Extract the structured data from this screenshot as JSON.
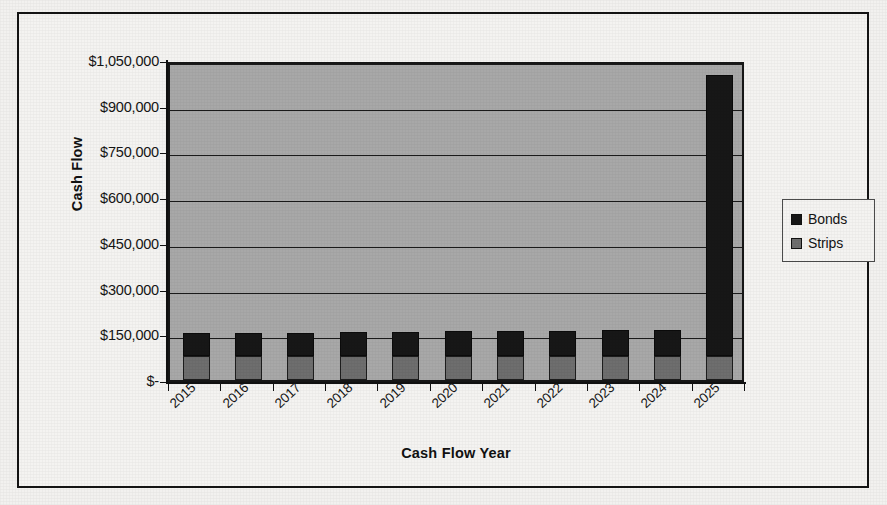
{
  "chart_data": {
    "type": "bar",
    "subtype": "stacked-column",
    "title": "",
    "xlabel": "Cash Flow Year",
    "ylabel": "Cash Flow",
    "categories": [
      "2015",
      "2016",
      "2017",
      "2018",
      "2019",
      "2020",
      "2021",
      "2022",
      "2023",
      "2024",
      "2025"
    ],
    "series": [
      {
        "name": "Strips",
        "color": "#6e6e6e",
        "values": [
          80000,
          80000,
          80000,
          80000,
          80000,
          80000,
          80000,
          80000,
          80000,
          80000,
          80000
        ]
      },
      {
        "name": "Bonds",
        "color": "#171717",
        "values": [
          75000,
          75000,
          75000,
          78000,
          78000,
          80000,
          82000,
          82000,
          84000,
          84000,
          920000
        ]
      }
    ],
    "ylim": [
      0,
      1050000
    ],
    "y_ticks": [
      0,
      150000,
      300000,
      450000,
      600000,
      750000,
      900000,
      1050000
    ],
    "y_tick_labels": [
      "$-",
      "$150,000",
      "$300,000",
      "$450,000",
      "$600,000",
      "$750,000",
      "$900,000",
      "$1,050,000"
    ],
    "grid": true,
    "grid_axis": "y",
    "legend_position": "right",
    "plot_background": "#a8a8a8",
    "chart_background": "#f4f3f1",
    "axis_color": "#111111"
  },
  "legend": {
    "items": [
      {
        "label": "Bonds",
        "color": "#171717"
      },
      {
        "label": "Strips",
        "color": "#6e6e6e"
      }
    ]
  }
}
